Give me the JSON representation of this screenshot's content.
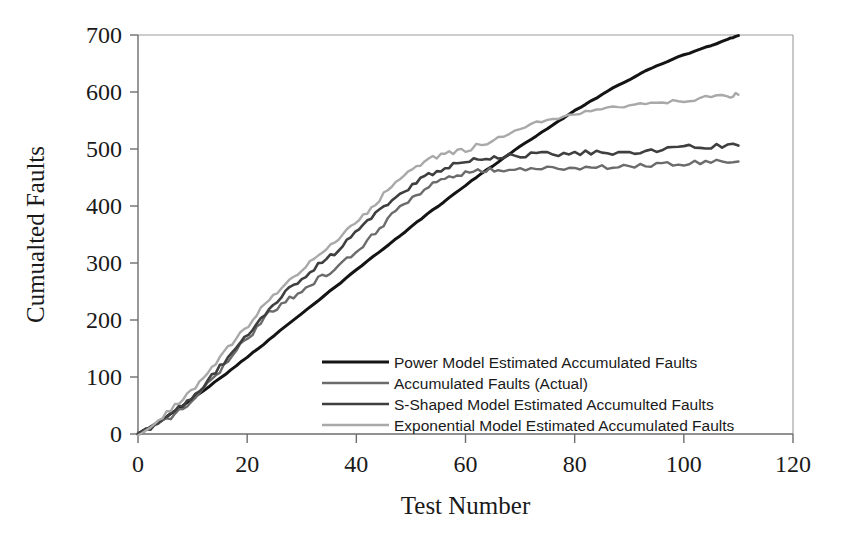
{
  "chart_data": {
    "type": "line",
    "title": "",
    "xlabel": "Test Number",
    "ylabel": "Cumualted Faults",
    "xlim": [
      0,
      120
    ],
    "ylim": [
      0,
      700
    ],
    "xticks": [
      "0",
      "20",
      "40",
      "60",
      "80",
      "100",
      "120"
    ],
    "yticks": [
      "0",
      "100",
      "200",
      "300",
      "400",
      "500",
      "600",
      "700"
    ],
    "grid": false,
    "legend_position": "inside-center-bottom",
    "series": [
      {
        "name": "Power Model Estimated Accumulated Faults",
        "color": "#141414",
        "width": 3.0,
        "x": [
          0,
          4,
          8,
          12,
          16,
          20,
          24,
          28,
          32,
          36,
          40,
          44,
          48,
          52,
          56,
          60,
          64,
          68,
          72,
          76,
          80,
          84,
          88,
          92,
          96,
          100,
          104,
          108,
          110
        ],
        "y": [
          0,
          22,
          48,
          76,
          105,
          135,
          165,
          196,
          227,
          257,
          288,
          318,
          348,
          378,
          407,
          436,
          464,
          491,
          517,
          542,
          567,
          590,
          612,
          632,
          650,
          665,
          678,
          692,
          699
        ]
      },
      {
        "name": "Accumulated Faults (Actual)",
        "color": "#6b6b6b",
        "width": 2.4,
        "x": [
          0,
          3,
          6,
          9,
          12,
          15,
          18,
          21,
          24,
          27,
          30,
          33,
          36,
          39,
          42,
          45,
          48,
          51,
          54,
          57,
          60,
          63,
          66,
          70,
          74,
          78,
          82,
          86,
          90,
          94,
          98,
          102,
          106,
          110
        ],
        "y": [
          0,
          12,
          30,
          52,
          78,
          110,
          148,
          178,
          212,
          232,
          252,
          272,
          290,
          312,
          338,
          368,
          398,
          420,
          438,
          450,
          458,
          462,
          463,
          464,
          465,
          466,
          467,
          468,
          469,
          471,
          474,
          476,
          477,
          478
        ]
      },
      {
        "name": "S-Shaped Model Estimated Accumulted Faults",
        "color": "#3f3f3f",
        "width": 2.6,
        "x": [
          0,
          3,
          6,
          9,
          12,
          15,
          18,
          21,
          24,
          27,
          30,
          33,
          36,
          39,
          42,
          45,
          48,
          51,
          54,
          57,
          60,
          63,
          66,
          70,
          74,
          78,
          82,
          86,
          90,
          94,
          98,
          102,
          106,
          110
        ],
        "y": [
          0,
          14,
          34,
          58,
          86,
          118,
          152,
          186,
          220,
          248,
          272,
          296,
          318,
          344,
          372,
          398,
          422,
          442,
          458,
          470,
          478,
          483,
          486,
          489,
          491,
          492,
          493,
          494,
          495,
          498,
          502,
          504,
          505,
          506
        ]
      },
      {
        "name": "Exponential Model Estimated Accumulated Faults",
        "color": "#a9a9a9",
        "width": 2.4,
        "x": [
          0,
          3,
          6,
          9,
          12,
          15,
          18,
          21,
          24,
          27,
          30,
          33,
          36,
          39,
          42,
          45,
          48,
          51,
          54,
          57,
          60,
          64,
          68,
          72,
          76,
          80,
          84,
          88,
          92,
          96,
          100,
          104,
          108,
          110
        ],
        "y": [
          0,
          18,
          42,
          68,
          98,
          132,
          168,
          200,
          236,
          262,
          288,
          312,
          336,
          362,
          390,
          420,
          448,
          470,
          486,
          492,
          498,
          512,
          528,
          542,
          554,
          564,
          570,
          574,
          578,
          582,
          586,
          590,
          593,
          595
        ]
      }
    ]
  }
}
